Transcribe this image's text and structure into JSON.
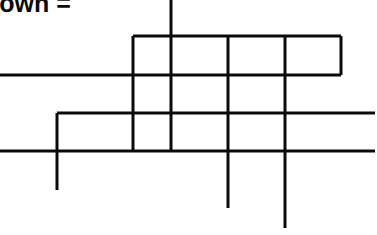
{
  "caption": {
    "text": "town ="
  },
  "diagram": {
    "stroke_color": "#0a0a0a",
    "stroke_width": 3,
    "horizontal_lines": [
      {
        "y": 36,
        "x1": 133,
        "x2": 341
      },
      {
        "y": 75,
        "x1": 0,
        "x2": 341
      },
      {
        "y": 113,
        "x1": 57,
        "x2": 375
      },
      {
        "y": 151,
        "x1": 0,
        "x2": 375
      }
    ],
    "vertical_lines": [
      {
        "x": 57,
        "y1": 113,
        "y2": 190
      },
      {
        "x": 133,
        "y1": 36,
        "y2": 151
      },
      {
        "x": 171,
        "y1": 0,
        "y2": 151
      },
      {
        "x": 228,
        "y1": 36,
        "y2": 208
      },
      {
        "x": 285,
        "y1": 36,
        "y2": 228
      },
      {
        "x": 341,
        "y1": 36,
        "y2": 75
      }
    ]
  }
}
